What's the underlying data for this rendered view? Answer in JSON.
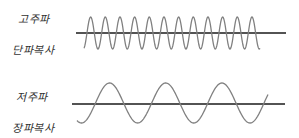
{
  "diagram": {
    "title": "",
    "waves": [
      {
        "name": "high-frequency",
        "label_top": "고주파",
        "label_bottom": "단파복사",
        "cycles": 12,
        "line_color": "#1a1a1a",
        "wave_color": "#808080"
      },
      {
        "name": "low-frequency",
        "label_top": "저주파",
        "label_bottom": "장파복사",
        "cycles": 3.4,
        "line_color": "#1a1a1a",
        "wave_color": "#808080"
      }
    ]
  }
}
